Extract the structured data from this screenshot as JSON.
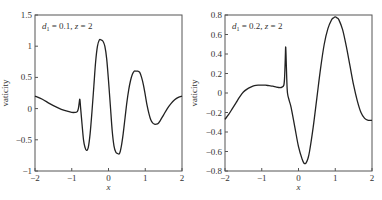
{
  "chart_data": [
    {
      "type": "line",
      "title": "",
      "annotation": "d1 = 0.1, z = 2",
      "annotation_parts": {
        "d": "d",
        "sub": "1",
        "rest": " = 0.1, z = 2"
      },
      "xlabel": "x",
      "ylabel": "vaticity",
      "xlim": [
        -2,
        2
      ],
      "ylim": [
        -1,
        1.5
      ],
      "xticks": [
        "-2",
        "-1",
        "0",
        "1",
        "2"
      ],
      "yticks": [
        "-1",
        "-0.5",
        "0",
        "0.5",
        "1",
        "1.5"
      ],
      "grid": false,
      "series": [
        {
          "name": "vorticity",
          "x": [
            -2.0,
            -1.8,
            -1.6,
            -1.4,
            -1.2,
            -1.0,
            -0.9,
            -0.85,
            -0.82,
            -0.8,
            -0.78,
            -0.76,
            -0.72,
            -0.68,
            -0.64,
            -0.6,
            -0.55,
            -0.5,
            -0.45,
            -0.4,
            -0.35,
            -0.3,
            -0.25,
            -0.2,
            -0.15,
            -0.1,
            -0.05,
            0.0,
            0.05,
            0.1,
            0.15,
            0.2,
            0.25,
            0.3,
            0.35,
            0.4,
            0.45,
            0.5,
            0.55,
            0.6,
            0.65,
            0.7,
            0.75,
            0.8,
            0.85,
            0.9,
            0.95,
            1.0,
            1.05,
            1.1,
            1.15,
            1.2,
            1.25,
            1.3,
            1.35,
            1.4,
            1.5,
            1.6,
            1.7,
            1.8,
            1.9,
            2.0
          ],
          "y": [
            0.2,
            0.15,
            0.08,
            0.02,
            -0.03,
            -0.06,
            -0.06,
            -0.05,
            0.0,
            0.08,
            0.15,
            0.02,
            -0.25,
            -0.5,
            -0.62,
            -0.67,
            -0.62,
            -0.4,
            -0.05,
            0.35,
            0.75,
            1.0,
            1.1,
            1.1,
            1.08,
            1.0,
            0.8,
            0.45,
            0.05,
            -0.35,
            -0.6,
            -0.7,
            -0.72,
            -0.72,
            -0.6,
            -0.4,
            -0.15,
            0.1,
            0.3,
            0.45,
            0.55,
            0.6,
            0.6,
            0.6,
            0.58,
            0.5,
            0.38,
            0.22,
            0.05,
            -0.08,
            -0.18,
            -0.23,
            -0.25,
            -0.25,
            -0.24,
            -0.2,
            -0.1,
            0.0,
            0.08,
            0.14,
            0.18,
            0.2
          ]
        }
      ]
    },
    {
      "type": "line",
      "title": "",
      "annotation": "d1 = 0.2, z = 2",
      "annotation_parts": {
        "d": "d",
        "sub": "1",
        "rest": " = 0.2, z = 2"
      },
      "xlabel": "x",
      "ylabel": "vaticity",
      "xlim": [
        -2,
        2
      ],
      "ylim": [
        -0.8,
        0.8
      ],
      "xticks": [
        "-2",
        "-1",
        "0",
        "1",
        "2"
      ],
      "yticks": [
        "-0.8",
        "-0.6",
        "-0.4",
        "-0.2",
        "0",
        "0.2",
        "0.4",
        "0.6",
        "0.8"
      ],
      "grid": false,
      "series": [
        {
          "name": "vorticity",
          "x": [
            -2.0,
            -1.9,
            -1.8,
            -1.7,
            -1.6,
            -1.5,
            -1.4,
            -1.3,
            -1.2,
            -1.1,
            -1.0,
            -0.9,
            -0.8,
            -0.7,
            -0.6,
            -0.5,
            -0.45,
            -0.4,
            -0.38,
            -0.36,
            -0.35,
            -0.34,
            -0.32,
            -0.3,
            -0.25,
            -0.2,
            -0.1,
            0.0,
            0.1,
            0.15,
            0.2,
            0.25,
            0.3,
            0.4,
            0.5,
            0.6,
            0.7,
            0.8,
            0.9,
            0.95,
            1.0,
            1.05,
            1.1,
            1.2,
            1.3,
            1.4,
            1.5,
            1.6,
            1.7,
            1.8,
            1.9,
            2.0
          ],
          "y": [
            -0.27,
            -0.22,
            -0.16,
            -0.1,
            -0.04,
            0.01,
            0.04,
            0.06,
            0.075,
            0.08,
            0.08,
            0.08,
            0.075,
            0.07,
            0.06,
            0.055,
            0.06,
            0.08,
            0.15,
            0.35,
            0.47,
            0.4,
            0.15,
            0.0,
            -0.08,
            -0.15,
            -0.35,
            -0.55,
            -0.68,
            -0.72,
            -0.72,
            -0.68,
            -0.6,
            -0.35,
            -0.05,
            0.25,
            0.5,
            0.66,
            0.75,
            0.77,
            0.78,
            0.77,
            0.75,
            0.65,
            0.48,
            0.28,
            0.08,
            -0.08,
            -0.2,
            -0.26,
            -0.28,
            -0.28
          ]
        }
      ]
    }
  ],
  "charts": [
    {
      "annotation_value": "= 0.1, z = 2"
    },
    {
      "annotation_value": "= 0.2, z = 2"
    }
  ]
}
